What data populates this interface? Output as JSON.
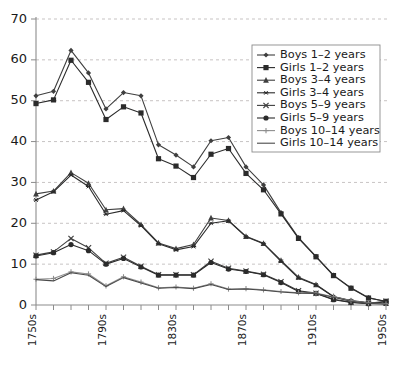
{
  "chart_data": {
    "type": "line",
    "title": "",
    "subtitle": "",
    "xlabel": "",
    "ylabel": "",
    "xlim": [
      "1750s",
      "1950s"
    ],
    "ylim": [
      0,
      70
    ],
    "ytick_values": [
      0,
      10,
      20,
      30,
      40,
      50,
      60,
      70
    ],
    "ytick_labels": [
      "0",
      "10",
      "20",
      "30",
      "40",
      "50",
      "60",
      "70"
    ],
    "grid": true,
    "grid_axis": "y",
    "legend_position": "upper-right",
    "categories": [
      "1750s",
      "1760s",
      "1770s",
      "1780s",
      "1790s",
      "1800s",
      "1810s",
      "1820s",
      "1830s",
      "1840s",
      "1850s",
      "1860s",
      "1870s",
      "1880s",
      "1890s",
      "1900s",
      "1910s",
      "1920s",
      "1930s",
      "1940s",
      "1950s"
    ],
    "xtick_labels": [
      "1750s",
      "1790s",
      "1830s",
      "1870s",
      "1910s",
      "1950s"
    ],
    "xtick_label_indices": [
      0,
      4,
      8,
      12,
      16,
      20
    ],
    "series": [
      {
        "name": "Boys 1–2 years",
        "marker": "diamond",
        "color": "#3f3f3f",
        "values": [
          51.2,
          52.3,
          62.3,
          56.8,
          48.0,
          52.0,
          51.2,
          39.2,
          36.7,
          33.8,
          40.2,
          41.0,
          33.8,
          29.4,
          22.6,
          16.5,
          11.9,
          7.3,
          4.2,
          1.8,
          0.8
        ]
      },
      {
        "name": "Girls 1–2 years",
        "marker": "square",
        "color": "#2b2b2b",
        "values": [
          49.3,
          50.2,
          59.9,
          54.5,
          45.4,
          48.5,
          47.0,
          35.8,
          34.0,
          31.2,
          36.9,
          38.3,
          32.2,
          28.2,
          22.3,
          16.3,
          11.8,
          7.2,
          4.1,
          1.7,
          0.9
        ]
      },
      {
        "name": "Boys 3–4 years",
        "marker": "triangle",
        "color": "#3f3f3f",
        "values": [
          27.2,
          27.9,
          32.4,
          29.8,
          23.3,
          23.6,
          19.7,
          15.2,
          13.8,
          14.8,
          21.3,
          20.7,
          16.8,
          15.1,
          10.9,
          6.8,
          5.0,
          2.1,
          1.1,
          0.6,
          0.4
        ]
      },
      {
        "name": "Girls 3–4 years",
        "marker": "asterisk",
        "color": "#2b2b2b",
        "values": [
          25.7,
          27.7,
          31.8,
          29.0,
          22.2,
          23.1,
          19.4,
          15.0,
          13.5,
          14.3,
          20.0,
          20.6,
          16.7,
          15.0,
          10.7,
          6.6,
          4.9,
          2.0,
          1.0,
          0.5,
          0.3
        ]
      },
      {
        "name": "Boys 5–9 years",
        "marker": "x",
        "color": "#3f3f3f",
        "values": [
          12.2,
          13.0,
          16.3,
          14.0,
          10.2,
          11.7,
          9.5,
          7.4,
          7.4,
          7.4,
          10.7,
          9.0,
          8.3,
          7.5,
          5.7,
          3.5,
          2.9,
          1.4,
          0.7,
          0.4,
          0.9
        ]
      },
      {
        "name": "Girls 5–9 years",
        "marker": "circle",
        "color": "#2b2b2b",
        "values": [
          12.0,
          12.8,
          14.8,
          13.3,
          10.0,
          11.4,
          9.3,
          7.3,
          7.3,
          7.3,
          10.4,
          8.8,
          8.2,
          7.4,
          5.5,
          3.3,
          2.8,
          1.3,
          0.6,
          0.3,
          0.8
        ]
      },
      {
        "name": "Boys 10–14 years",
        "marker": "plus",
        "color": "#8e8e8e",
        "values": [
          6.3,
          6.5,
          8.1,
          7.6,
          4.7,
          6.9,
          5.6,
          4.2,
          4.4,
          4.1,
          5.2,
          3.9,
          4.0,
          3.7,
          3.3,
          3.0,
          2.9,
          2.0,
          1.0,
          0.5,
          0.3
        ]
      },
      {
        "name": "Girls 10–14 years",
        "marker": "none",
        "color": "#4a4a4a",
        "values": [
          6.2,
          5.9,
          7.9,
          7.3,
          4.5,
          6.7,
          5.4,
          4.1,
          4.3,
          4.0,
          5.0,
          3.8,
          3.9,
          3.6,
          3.2,
          2.9,
          2.8,
          1.9,
          0.9,
          0.4,
          0.2
        ]
      }
    ]
  },
  "legend": {
    "items": [
      {
        "label": "Boys 1–2 years"
      },
      {
        "label": "Girls 1–2 years"
      },
      {
        "label": "Boys 3–4 years"
      },
      {
        "label": "Girls 3–4 years"
      },
      {
        "label": "Boys 5–9 years"
      },
      {
        "label": "Girls 5–9 years"
      },
      {
        "label": "Boys 10–14 years"
      },
      {
        "label": "Girls 10–14 years"
      }
    ]
  },
  "colors": {
    "background": "#ffffff",
    "axis": "#8c8c8c",
    "grid": "#b9b4b4",
    "text": "#1a1a1a"
  }
}
